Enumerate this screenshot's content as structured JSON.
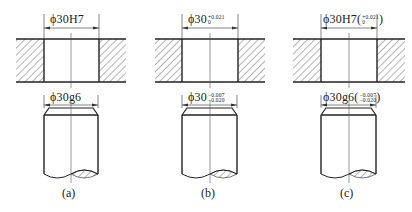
{
  "figure": {
    "panels": [
      {
        "id": "a",
        "caption": "(a)",
        "hole": {
          "prefix": "ϕ30H7",
          "upper": "",
          "lower": "",
          "paren": false
        },
        "shaft": {
          "prefix": "ϕ30g6",
          "upper": "",
          "lower": "",
          "paren": false
        }
      },
      {
        "id": "b",
        "caption": "(b)",
        "hole": {
          "prefix": "ϕ30",
          "upper": "+0.021",
          "lower": "0",
          "paren": false
        },
        "shaft": {
          "prefix": "ϕ30",
          "upper": "−0.007",
          "lower": "−0.020",
          "paren": false
        }
      },
      {
        "id": "c",
        "caption": "(c)",
        "hole": {
          "prefix": "ϕ30H7",
          "upper": "+0.021",
          "lower": "0",
          "paren": true,
          "open": "(",
          "close": ")"
        },
        "shaft": {
          "prefix": "ϕ30g6",
          "upper": "−0.007",
          "lower": "−0.020",
          "paren": true,
          "open": "(",
          "close": ")"
        }
      }
    ],
    "colors": {
      "line": "#222222",
      "hatch": "#444444",
      "background": "#ffffff"
    }
  }
}
